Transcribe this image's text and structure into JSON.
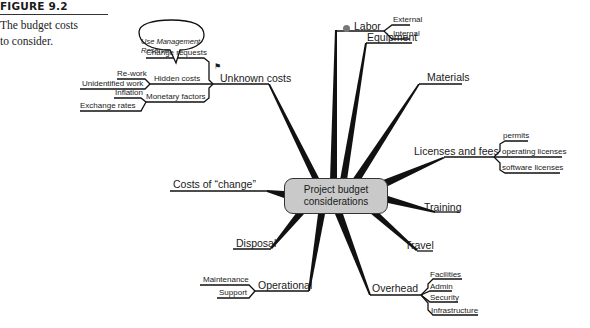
{
  "figure": {
    "label": "FIGURE 9.2",
    "description_line1": "The budget costs",
    "description_line2": "to consider."
  },
  "center": {
    "line1": "Project budget",
    "line2": "considerations"
  },
  "callout": {
    "line1": "Use Management",
    "line2": "Reserve",
    "flag_icon": "⚑"
  },
  "branches": {
    "labor": {
      "label": "Labor",
      "children": [
        "External",
        "Internal"
      ]
    },
    "equipment": {
      "label": "Equipment"
    },
    "materials": {
      "label": "Materials"
    },
    "licenses": {
      "label": "Licenses and fees",
      "children": [
        "permits",
        "operating licenses",
        "software licenses"
      ]
    },
    "training": {
      "label": "Training"
    },
    "travel": {
      "label": "Travel"
    },
    "overhead": {
      "label": "Overhead",
      "children": [
        "Facilities",
        "Admin",
        "Security",
        "Infrastructure"
      ]
    },
    "operational": {
      "label": "Operational",
      "children": [
        "Maintenance",
        "Support"
      ]
    },
    "disposal": {
      "label": "Disposal"
    },
    "costs_of_change": {
      "label": "Costs of “change”"
    },
    "unknown": {
      "label": "Unknown  costs",
      "children": {
        "change_requests": "Change requests",
        "hidden_costs": "Hidden costs",
        "hidden_children": [
          "Re-work",
          "Unidentified work"
        ],
        "monetary_factors": "Monetary factors",
        "monetary_children": [
          "Inflation",
          "Exchange rates"
        ]
      }
    }
  }
}
